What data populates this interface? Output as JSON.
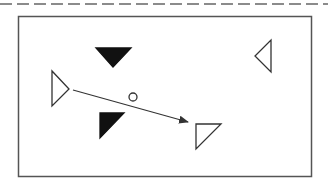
{
  "canvas": {
    "width": 328,
    "height": 186,
    "background": "#ffffff"
  },
  "colors": {
    "stroke": "#333333",
    "frame": "#555555",
    "dash": "#666666",
    "fill_dark": "#111111",
    "fill_light": "#ffffff"
  },
  "separator": {
    "type": "dashed-line",
    "y": 4,
    "x1": 0,
    "x2": 328,
    "dash": "12 5"
  },
  "frame": {
    "x": 18,
    "y": 16,
    "width": 293,
    "height": 160
  },
  "shapes": [
    {
      "name": "filled-down-triangle",
      "kind": "triangle",
      "filled": true,
      "points": [
        [
          96,
          48
        ],
        [
          131,
          48
        ],
        [
          113,
          67
        ]
      ]
    },
    {
      "name": "outline-right-triangle",
      "kind": "triangle",
      "filled": false,
      "points": [
        [
          52,
          71
        ],
        [
          52,
          106
        ],
        [
          69,
          89
        ]
      ]
    },
    {
      "name": "filled-corner-triangle",
      "kind": "triangle",
      "filled": true,
      "points": [
        [
          100,
          113
        ],
        [
          124,
          113
        ],
        [
          100,
          138
        ]
      ]
    },
    {
      "name": "outline-corner-triangle",
      "kind": "triangle",
      "filled": false,
      "points": [
        [
          196,
          124
        ],
        [
          221,
          124
        ],
        [
          196,
          149
        ]
      ]
    },
    {
      "name": "outline-left-triangle",
      "kind": "triangle",
      "filled": false,
      "points": [
        [
          271,
          40
        ],
        [
          271,
          72
        ],
        [
          255,
          56
        ]
      ]
    },
    {
      "name": "small-circle",
      "kind": "circle",
      "filled": false,
      "cx": 133,
      "cy": 97,
      "r": 4
    }
  ],
  "arrow": {
    "from": [
      73,
      90
    ],
    "to": [
      188,
      122
    ]
  }
}
